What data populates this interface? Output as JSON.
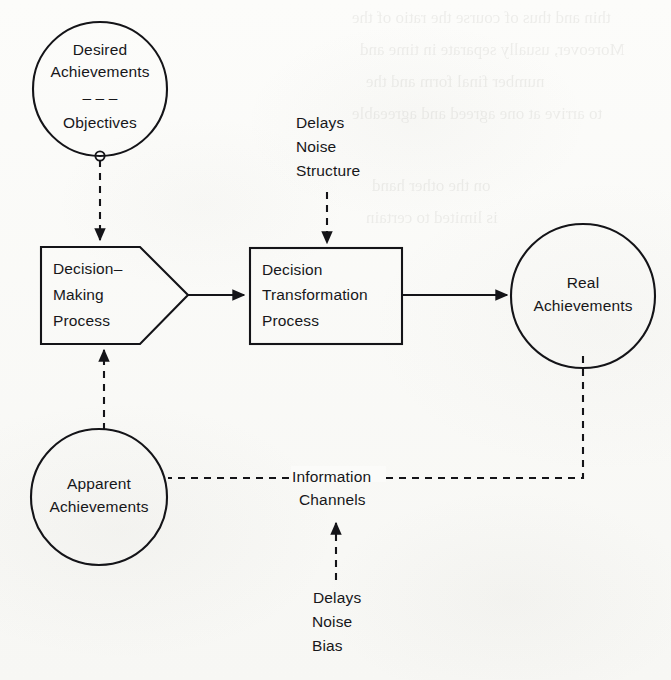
{
  "figure": {
    "background_color": "#fbfbf9",
    "ink_color": "#141418"
  },
  "nodes": {
    "desired_achievements": {
      "shape": "ellipse",
      "line1": "Desired",
      "line2": "Achievements",
      "separator": "– – –",
      "line3": "Objectives"
    },
    "decision_making_process": {
      "shape": "pentagon",
      "line1": "Decision–",
      "line2": "Making",
      "line3": "Process"
    },
    "decision_transformation_process": {
      "shape": "rectangle",
      "line1": "Decision",
      "line2": "Transformation",
      "line3": "Process"
    },
    "real_achievements": {
      "shape": "circle",
      "line1": "Real",
      "line2": "Achievements"
    },
    "apparent_achievements": {
      "shape": "circle",
      "line1": "Apparent",
      "line2": "Achievements"
    }
  },
  "annotations": {
    "transformation_disturbances": {
      "line1": "Delays",
      "line2": "Noise",
      "line3": "Structure"
    },
    "information_channels": {
      "line1": "Information",
      "line2": "Channels"
    },
    "channel_disturbances": {
      "line1": "Delays",
      "line2": "Noise",
      "line3": "Bias"
    }
  },
  "connections": [
    {
      "name": "objectives-to-decision-making",
      "style": "dashed",
      "arrow": true
    },
    {
      "name": "decision-making-to-transformation",
      "style": "solid",
      "arrow": true
    },
    {
      "name": "transformation-to-real-achievements",
      "style": "solid",
      "arrow": true
    },
    {
      "name": "structure-disturbance-to-transformation",
      "style": "dashed",
      "arrow": true
    },
    {
      "name": "real-achievements-to-information-channels",
      "style": "dashed",
      "arrow": false
    },
    {
      "name": "information-channels-to-apparent-achievements",
      "style": "dashed",
      "arrow": false
    },
    {
      "name": "apparent-achievements-to-decision-making",
      "style": "dashed",
      "arrow": true
    },
    {
      "name": "bias-disturbance-to-information-channels",
      "style": "dashed",
      "arrow": true
    }
  ],
  "bleed_through": [
    {
      "text": "thin and thus of course the ratio of the",
      "x": 352,
      "y": 8
    },
    {
      "text": "Moreover, usually separate in time and",
      "x": 360,
      "y": 40
    },
    {
      "text": "number final form and the",
      "x": 366,
      "y": 72
    },
    {
      "text": "to arrive at one agreed and agreeable",
      "x": 352,
      "y": 104
    },
    {
      "text": "on the other hand",
      "x": 372,
      "y": 176
    },
    {
      "text": "is limited to certain",
      "x": 366,
      "y": 208
    }
  ]
}
